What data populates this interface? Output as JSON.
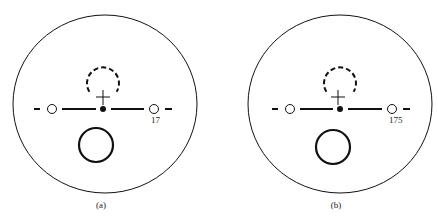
{
  "figure": {
    "panels": [
      {
        "id": "a",
        "caption": "(a)",
        "marker_label": "17",
        "outer_circle": {
          "cx": 105,
          "cy": 104,
          "rx": 92,
          "ry": 89
        },
        "axis_y": 109,
        "center_dot_x": 103,
        "left_ring_x": 52,
        "right_ring_x": 154,
        "dashed_circle": {
          "cx": 103,
          "cy": 83,
          "r": 16
        },
        "cross": {
          "x": 103,
          "y": 97
        },
        "bold_circle": {
          "cx": 96,
          "cy": 145,
          "r": 17
        }
      },
      {
        "id": "b",
        "caption": "(b)",
        "marker_label": "175",
        "outer_circle": {
          "cx": 340,
          "cy": 104,
          "rx": 92,
          "ry": 89
        },
        "axis_y": 109,
        "center_dot_x": 340,
        "left_ring_x": 290,
        "right_ring_x": 392,
        "dashed_circle": {
          "cx": 340,
          "cy": 83,
          "r": 16
        },
        "cross": {
          "x": 338,
          "y": 97
        },
        "bold_circle": {
          "cx": 333,
          "cy": 147,
          "r": 17
        }
      }
    ],
    "colors": {
      "stroke": "#111111",
      "background": "#ffffff"
    }
  }
}
